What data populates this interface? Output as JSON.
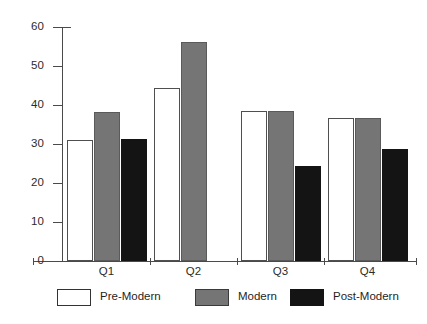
{
  "chart_data": {
    "type": "bar",
    "title": "",
    "subtitle": "",
    "xlabel": "",
    "ylabel": "",
    "categories": [
      "Q1",
      "Q2",
      "Q3",
      "Q4"
    ],
    "series": [
      {
        "name": "Pre-Modern",
        "color": "#ffffff",
        "values": [
          31.0,
          44.3,
          38.4,
          36.7
        ]
      },
      {
        "name": "Modern",
        "color": "#757575",
        "values": [
          38.3,
          56.2,
          38.4,
          36.7
        ]
      },
      {
        "name": "Post-Modern",
        "color": "#141414",
        "values": [
          31.2,
          0,
          24.4,
          28.6
        ]
      }
    ],
    "ylim": [
      0,
      60
    ],
    "yticks": [
      0,
      10,
      20,
      30,
      40,
      50,
      60
    ],
    "ytick_labels": [
      "0",
      "10",
      "20",
      "30",
      "40",
      "50",
      "60"
    ],
    "grid": false,
    "legend_position": "bottom"
  },
  "legend": {
    "items": [
      {
        "label": "Pre-Modern",
        "swatch": "pre"
      },
      {
        "label": "Modern",
        "swatch": "mod"
      },
      {
        "label": "Post-Modern",
        "swatch": "post"
      }
    ]
  }
}
